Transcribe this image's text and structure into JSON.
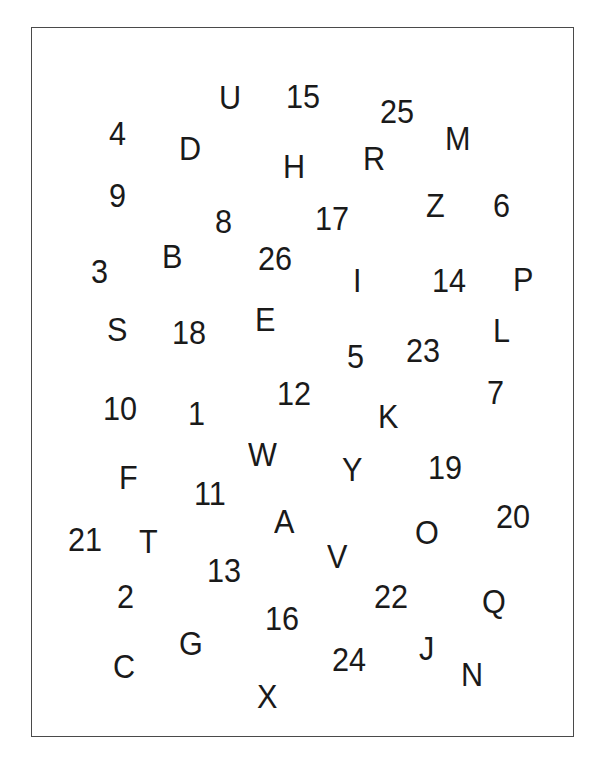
{
  "worksheet": {
    "description": "Connect-the-dots style scattered letters and numbers",
    "items": [
      {
        "label": "U",
        "x": 219,
        "y": 84
      },
      {
        "label": "15",
        "x": 286,
        "y": 83
      },
      {
        "label": "25",
        "x": 380,
        "y": 98
      },
      {
        "label": "4",
        "x": 109,
        "y": 120
      },
      {
        "label": "D",
        "x": 179,
        "y": 135
      },
      {
        "label": "M",
        "x": 445,
        "y": 125
      },
      {
        "label": "H",
        "x": 283,
        "y": 153
      },
      {
        "label": "R",
        "x": 363,
        "y": 145
      },
      {
        "label": "9",
        "x": 109,
        "y": 182
      },
      {
        "label": "8",
        "x": 215,
        "y": 208
      },
      {
        "label": "17",
        "x": 315,
        "y": 205
      },
      {
        "label": "Z",
        "x": 426,
        "y": 192
      },
      {
        "label": "6",
        "x": 493,
        "y": 192
      },
      {
        "label": "3",
        "x": 91,
        "y": 258
      },
      {
        "label": "B",
        "x": 162,
        "y": 243
      },
      {
        "label": "26",
        "x": 258,
        "y": 245
      },
      {
        "label": "I",
        "x": 353,
        "y": 267
      },
      {
        "label": "14",
        "x": 432,
        "y": 267
      },
      {
        "label": "P",
        "x": 513,
        "y": 266
      },
      {
        "label": "S",
        "x": 107,
        "y": 316
      },
      {
        "label": "18",
        "x": 172,
        "y": 319
      },
      {
        "label": "E",
        "x": 255,
        "y": 306
      },
      {
        "label": "5",
        "x": 347,
        "y": 343
      },
      {
        "label": "23",
        "x": 406,
        "y": 337
      },
      {
        "label": "L",
        "x": 493,
        "y": 317
      },
      {
        "label": "10",
        "x": 103,
        "y": 395
      },
      {
        "label": "1",
        "x": 188,
        "y": 400
      },
      {
        "label": "12",
        "x": 277,
        "y": 380
      },
      {
        "label": "K",
        "x": 378,
        "y": 403
      },
      {
        "label": "7",
        "x": 487,
        "y": 379
      },
      {
        "label": "W",
        "x": 248,
        "y": 441
      },
      {
        "label": "F",
        "x": 119,
        "y": 464
      },
      {
        "label": "11",
        "x": 194,
        "y": 480
      },
      {
        "label": "Y",
        "x": 342,
        "y": 456
      },
      {
        "label": "19",
        "x": 428,
        "y": 454
      },
      {
        "label": "A",
        "x": 274,
        "y": 508
      },
      {
        "label": "20",
        "x": 496,
        "y": 503
      },
      {
        "label": "21",
        "x": 68,
        "y": 526
      },
      {
        "label": "T",
        "x": 139,
        "y": 528
      },
      {
        "label": "O",
        "x": 415,
        "y": 519
      },
      {
        "label": "V",
        "x": 327,
        "y": 543
      },
      {
        "label": "13",
        "x": 207,
        "y": 557
      },
      {
        "label": "2",
        "x": 117,
        "y": 583
      },
      {
        "label": "22",
        "x": 374,
        "y": 583
      },
      {
        "label": "Q",
        "x": 482,
        "y": 588
      },
      {
        "label": "16",
        "x": 265,
        "y": 605
      },
      {
        "label": "G",
        "x": 179,
        "y": 630
      },
      {
        "label": "J",
        "x": 419,
        "y": 635
      },
      {
        "label": "24",
        "x": 332,
        "y": 646
      },
      {
        "label": "C",
        "x": 113,
        "y": 653
      },
      {
        "label": "N",
        "x": 461,
        "y": 661
      },
      {
        "label": "X",
        "x": 257,
        "y": 683
      }
    ]
  }
}
